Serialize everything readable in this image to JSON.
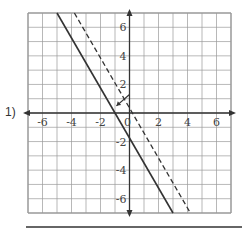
{
  "problem": {
    "number_label": "1)"
  },
  "graph": {
    "x_range": [
      -7,
      7
    ],
    "y_range": [
      -7,
      7
    ],
    "x_tick_labels": [
      "-6",
      "-4",
      "-2",
      "0",
      "2",
      "4",
      "6"
    ],
    "y_tick_labels": [
      "6",
      "4",
      "2",
      "-2",
      "-4",
      "-6"
    ],
    "lines": [
      {
        "style": "solid",
        "from": [
          -5,
          7
        ],
        "to": [
          3,
          -7
        ]
      },
      {
        "style": "dashed",
        "from": [
          -3.8,
          7
        ],
        "to": [
          4.2,
          -7
        ]
      }
    ],
    "annotation": {
      "type": "arrow",
      "from": [
        0,
        1.3
      ],
      "to": [
        -0.9,
        0.5
      ]
    },
    "colors": {
      "grid": "#999999",
      "axes": "#333333",
      "lines": "#333333"
    }
  }
}
